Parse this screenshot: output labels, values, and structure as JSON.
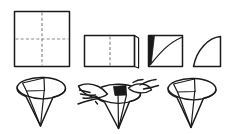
{
  "document": {
    "title": "Paper Cone Folding Instructions",
    "type": "instructional-line-diagram",
    "background_color": "#ffffff",
    "ink_color": "#1a1a1a",
    "fold_line_color": "#8a8a8a",
    "width": 227,
    "height": 134
  },
  "rows": [
    {
      "name": "top-row",
      "description": "Flat paper folding sequence",
      "steps": [
        {
          "id": "step-1",
          "label": "square-with-cross-folds",
          "shape": "square",
          "annotation": "Square sheet with horizontal and vertical dashed fold lines crossing at center",
          "has_fold_lines": true,
          "fold_line_style": "dashed"
        },
        {
          "id": "step-2",
          "label": "folded-rectangle",
          "shape": "rectangle",
          "annotation": "Sheet folded in half into a rectangle with a vertical dashed center line and a lifted corner flap on the right",
          "has_fold_lines": true,
          "fold_line_style": "dashed"
        },
        {
          "id": "step-3",
          "label": "square-with-arc-cut",
          "shape": "square-with-curve",
          "annotation": "Folded square with a dark filled wedge at the left edge and a curved arc drawn from lower-left to upper-right",
          "has_fold_lines": false,
          "fold_line_style": "none"
        },
        {
          "id": "step-4",
          "label": "quarter-circle",
          "shape": "quadrant",
          "annotation": "Resulting quarter-circle piece with straight left and bottom edges and a convex arc",
          "has_fold_lines": false,
          "fold_line_style": "none"
        }
      ]
    },
    {
      "name": "bottom-row",
      "description": "Cone forming sequence",
      "steps": [
        {
          "id": "step-5",
          "label": "open-cone",
          "shape": "cone",
          "annotation": "Quarter circle rolled into an open cone with elliptical rim and a visible overlapping seam flap at the upper left",
          "has_hands": false
        },
        {
          "id": "step-6",
          "label": "cone-held-by-hands",
          "shape": "cone-with-hands",
          "annotation": "Two hands holding and adjusting the rolled cone to overlap the seam",
          "has_hands": true
        },
        {
          "id": "step-7",
          "label": "finished-cone",
          "shape": "cone",
          "annotation": "Completed paper cone with sealed seam, elliptical rim and pointed tip",
          "has_hands": false
        }
      ]
    }
  ]
}
